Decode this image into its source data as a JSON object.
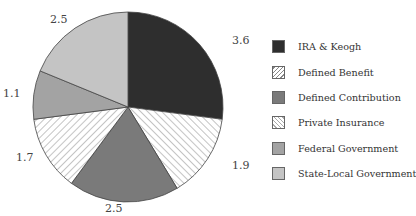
{
  "chart_data": {
    "type": "pie",
    "title": "",
    "categories": [
      "IRA & Keogh",
      "Defined Benefit",
      "Defined Contribution",
      "Private Insurance",
      "Federal Government",
      "State-Local Government"
    ],
    "values": [
      3.6,
      1.9,
      2.5,
      1.7,
      1.1,
      2.5
    ],
    "start_angle": "12 o'clock",
    "direction": "clockwise",
    "legend_position": "right",
    "data_labels": [
      "3.6",
      "1.9",
      "2.5",
      "1.7",
      "1.1",
      "2.5"
    ]
  },
  "slices": [
    {
      "label": "IRA & Keogh",
      "value": 3.6,
      "display": "3.6",
      "fill": "#2e2e2e",
      "pattern": "solid"
    },
    {
      "label": "Defined Benefit",
      "value": 1.9,
      "display": "1.9",
      "fill": "#ffffff",
      "pattern": "hatch-forward"
    },
    {
      "label": "Defined Contribution",
      "value": 2.5,
      "display": "2.5",
      "fill": "#7a7a7a",
      "pattern": "solid"
    },
    {
      "label": "Private Insurance",
      "value": 1.7,
      "display": "1.7",
      "fill": "#ffffff",
      "pattern": "hatch-back"
    },
    {
      "label": "Federal Government",
      "value": 1.1,
      "display": "1.1",
      "fill": "#a3a3a3",
      "pattern": "solid"
    },
    {
      "label": "State-Local Government",
      "value": 2.5,
      "display": "2.5",
      "fill": "#c4c4c4",
      "pattern": "solid"
    }
  ],
  "labels": {
    "ira": "3.6",
    "db": "1.9",
    "dc": "2.5",
    "pi": "1.7",
    "fed": "1.1",
    "sl": "2.5"
  },
  "legend": [
    {
      "label": "IRA & Keogh"
    },
    {
      "label": "Defined Benefit"
    },
    {
      "label": "Defined Contribution"
    },
    {
      "label": "Private Insurance"
    },
    {
      "label": "Federal Government"
    },
    {
      "label": "State-Local Government"
    }
  ]
}
